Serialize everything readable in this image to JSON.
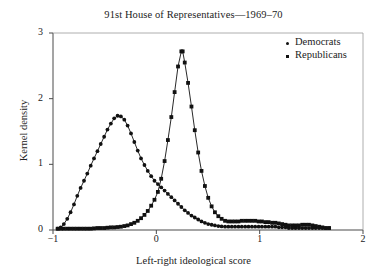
{
  "chart_data": {
    "type": "line",
    "title": "91st House of Representatives—1969–70",
    "xlabel": "Left-right ideological score",
    "ylabel": "Kernel density",
    "xlim": [
      -1,
      2
    ],
    "ylim": [
      0,
      3
    ],
    "xticks": [
      -1,
      0,
      1,
      2
    ],
    "xtick_labels": [
      "−1",
      "0",
      "1",
      "2"
    ],
    "yticks": [
      0,
      1,
      2,
      3
    ],
    "ytick_labels": [
      "0",
      "1",
      "2",
      "3"
    ],
    "grid": false,
    "legend_position": "top-right",
    "series": [
      {
        "name": "Democrats",
        "marker": "circle",
        "color": "#111111",
        "points": [
          [
            -0.955,
            0.02
          ],
          [
            -0.925,
            0.04
          ],
          [
            -0.895,
            0.09
          ],
          [
            -0.862,
            0.17
          ],
          [
            -0.83,
            0.27
          ],
          [
            -0.797,
            0.39
          ],
          [
            -0.765,
            0.52
          ],
          [
            -0.733,
            0.64
          ],
          [
            -0.7,
            0.75
          ],
          [
            -0.668,
            0.86
          ],
          [
            -0.635,
            0.98
          ],
          [
            -0.603,
            1.09
          ],
          [
            -0.57,
            1.2
          ],
          [
            -0.538,
            1.31
          ],
          [
            -0.505,
            1.42
          ],
          [
            -0.473,
            1.53
          ],
          [
            -0.44,
            1.62
          ],
          [
            -0.408,
            1.7
          ],
          [
            -0.375,
            1.74
          ],
          [
            -0.343,
            1.73
          ],
          [
            -0.31,
            1.68
          ],
          [
            -0.278,
            1.59
          ],
          [
            -0.245,
            1.47
          ],
          [
            -0.213,
            1.34
          ],
          [
            -0.18,
            1.21
          ],
          [
            -0.148,
            1.09
          ],
          [
            -0.115,
            0.99
          ],
          [
            -0.083,
            0.9
          ],
          [
            -0.05,
            0.82
          ],
          [
            -0.018,
            0.75
          ],
          [
            0.015,
            0.7
          ],
          [
            0.047,
            0.65
          ],
          [
            0.08,
            0.6
          ],
          [
            0.112,
            0.55
          ],
          [
            0.145,
            0.5
          ],
          [
            0.177,
            0.45
          ],
          [
            0.21,
            0.4
          ],
          [
            0.242,
            0.35
          ],
          [
            0.275,
            0.3
          ],
          [
            0.307,
            0.26
          ],
          [
            0.34,
            0.22
          ],
          [
            0.372,
            0.19
          ],
          [
            0.405,
            0.16
          ],
          [
            0.437,
            0.13
          ],
          [
            0.47,
            0.11
          ],
          [
            0.502,
            0.09
          ],
          [
            0.535,
            0.08
          ],
          [
            0.567,
            0.07
          ],
          [
            0.6,
            0.06
          ],
          [
            0.632,
            0.055
          ],
          [
            0.665,
            0.05
          ],
          [
            0.697,
            0.05
          ],
          [
            0.73,
            0.05
          ],
          [
            0.762,
            0.05
          ],
          [
            0.795,
            0.05
          ],
          [
            0.827,
            0.05
          ],
          [
            0.86,
            0.05
          ],
          [
            0.892,
            0.05
          ],
          [
            0.925,
            0.05
          ],
          [
            0.957,
            0.05
          ],
          [
            0.99,
            0.05
          ],
          [
            1.022,
            0.05
          ],
          [
            1.055,
            0.05
          ],
          [
            1.087,
            0.05
          ],
          [
            1.12,
            0.05
          ],
          [
            1.152,
            0.05
          ],
          [
            1.185,
            0.04
          ],
          [
            1.217,
            0.04
          ],
          [
            1.25,
            0.04
          ],
          [
            1.282,
            0.03
          ],
          [
            1.315,
            0.03
          ],
          [
            1.347,
            0.03
          ],
          [
            1.38,
            0.03
          ],
          [
            1.412,
            0.03
          ],
          [
            1.445,
            0.03
          ],
          [
            1.477,
            0.03
          ],
          [
            1.51,
            0.03
          ],
          [
            1.542,
            0.03
          ],
          [
            1.575,
            0.03
          ],
          [
            1.607,
            0.03
          ],
          [
            1.64,
            0.03
          ],
          [
            1.672,
            0.03
          ]
        ]
      },
      {
        "name": "Republicans",
        "marker": "square",
        "color": "#111111",
        "points": [
          [
            -0.955,
            0.02
          ],
          [
            -0.925,
            0.02
          ],
          [
            -0.895,
            0.02
          ],
          [
            -0.862,
            0.02
          ],
          [
            -0.83,
            0.02
          ],
          [
            -0.797,
            0.02
          ],
          [
            -0.765,
            0.02
          ],
          [
            -0.733,
            0.02
          ],
          [
            -0.7,
            0.02
          ],
          [
            -0.668,
            0.02
          ],
          [
            -0.635,
            0.02
          ],
          [
            -0.603,
            0.025
          ],
          [
            -0.57,
            0.03
          ],
          [
            -0.538,
            0.03
          ],
          [
            -0.505,
            0.03
          ],
          [
            -0.473,
            0.035
          ],
          [
            -0.44,
            0.04
          ],
          [
            -0.408,
            0.04
          ],
          [
            -0.375,
            0.045
          ],
          [
            -0.343,
            0.05
          ],
          [
            -0.31,
            0.06
          ],
          [
            -0.278,
            0.07
          ],
          [
            -0.245,
            0.09
          ],
          [
            -0.213,
            0.11
          ],
          [
            -0.18,
            0.14
          ],
          [
            -0.148,
            0.18
          ],
          [
            -0.115,
            0.23
          ],
          [
            -0.083,
            0.29
          ],
          [
            -0.05,
            0.37
          ],
          [
            -0.018,
            0.46
          ],
          [
            0.015,
            0.58
          ],
          [
            0.047,
            0.78
          ],
          [
            0.08,
            1.05
          ],
          [
            0.112,
            1.37
          ],
          [
            0.145,
            1.72
          ],
          [
            0.177,
            2.1
          ],
          [
            0.21,
            2.49
          ],
          [
            0.242,
            2.72
          ],
          [
            0.255,
            2.72
          ],
          [
            0.275,
            2.55
          ],
          [
            0.307,
            2.24
          ],
          [
            0.34,
            1.88
          ],
          [
            0.372,
            1.52
          ],
          [
            0.405,
            1.18
          ],
          [
            0.437,
            0.9
          ],
          [
            0.47,
            0.67
          ],
          [
            0.502,
            0.49
          ],
          [
            0.535,
            0.36
          ],
          [
            0.567,
            0.27
          ],
          [
            0.6,
            0.21
          ],
          [
            0.632,
            0.17
          ],
          [
            0.665,
            0.14
          ],
          [
            0.697,
            0.13
          ],
          [
            0.73,
            0.13
          ],
          [
            0.762,
            0.13
          ],
          [
            0.795,
            0.13
          ],
          [
            0.827,
            0.14
          ],
          [
            0.86,
            0.14
          ],
          [
            0.892,
            0.14
          ],
          [
            0.925,
            0.14
          ],
          [
            0.957,
            0.14
          ],
          [
            0.99,
            0.13
          ],
          [
            1.022,
            0.13
          ],
          [
            1.055,
            0.12
          ],
          [
            1.087,
            0.12
          ],
          [
            1.12,
            0.11
          ],
          [
            1.152,
            0.11
          ],
          [
            1.185,
            0.1
          ],
          [
            1.217,
            0.09
          ],
          [
            1.25,
            0.08
          ],
          [
            1.282,
            0.07
          ],
          [
            1.315,
            0.07
          ],
          [
            1.347,
            0.07
          ],
          [
            1.38,
            0.07
          ],
          [
            1.412,
            0.08
          ],
          [
            1.445,
            0.08
          ],
          [
            1.477,
            0.08
          ],
          [
            1.51,
            0.07
          ],
          [
            1.542,
            0.06
          ],
          [
            1.575,
            0.05
          ],
          [
            1.607,
            0.04
          ],
          [
            1.64,
            0.03
          ],
          [
            1.672,
            0.03
          ]
        ]
      }
    ],
    "annotations": {
      "democrat_peak": {
        "x": -0.375,
        "y": 1.74
      },
      "republican_peak": {
        "x": 0.248,
        "y": 2.72
      },
      "crossover": {
        "x": 0.06,
        "y": 0.69
      }
    }
  },
  "legend": {
    "items": [
      {
        "label": "Democrats",
        "marker": "dot"
      },
      {
        "label": "Republicans",
        "marker": "square"
      }
    ]
  }
}
